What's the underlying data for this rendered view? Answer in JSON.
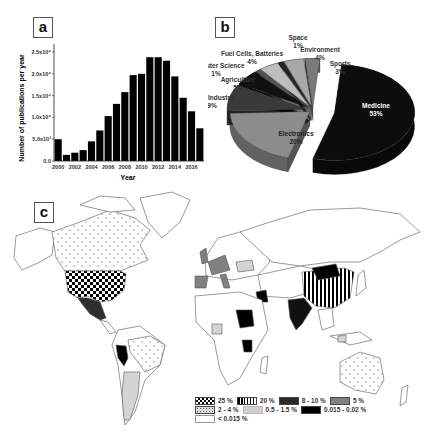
{
  "panels": {
    "a": "a",
    "b": "b",
    "c": "c"
  },
  "chart_data": [
    {
      "type": "bar",
      "title": "",
      "xlabel": "Year",
      "ylabel": "Number of publications per year",
      "categories": [
        "2000",
        "2001",
        "2002",
        "2003",
        "2004",
        "2005",
        "2006",
        "2007",
        "2008",
        "2009",
        "2010",
        "2011",
        "2012",
        "2013",
        "2014",
        "2015",
        "2016",
        "2017"
      ],
      "values": [
        5000,
        1400,
        1900,
        2500,
        4500,
        7000,
        10300,
        13100,
        15800,
        19700,
        20000,
        23800,
        23800,
        23000,
        19400,
        14500,
        11400,
        7500
      ],
      "x_tick_labels": [
        "2000",
        "2002",
        "2004",
        "2006",
        "2008",
        "2010",
        "2012",
        "2014",
        "2016"
      ],
      "y_tick_labels": [
        "0.0",
        "5.0x10³",
        "1.0x10⁴",
        "1.5x10⁴",
        "2.0x10⁴",
        "2.5x10⁴"
      ],
      "ylim": [
        0,
        27000
      ],
      "bar_color": "#000000",
      "grid": false
    },
    {
      "type": "pie",
      "title": "",
      "style": "3d-exploded",
      "slices": [
        {
          "label": "Medicine",
          "value": 53,
          "text": "53%",
          "color": "#0d0d0d"
        },
        {
          "label": "Electronics",
          "value": 20,
          "text": "20%",
          "color": "#8c8c8c"
        },
        {
          "label": "Food Industry",
          "value": 9,
          "text": "9%",
          "color": "#3a3a3a"
        },
        {
          "label": "Agriculture",
          "value": 5,
          "text": "5%",
          "color": "#111111"
        },
        {
          "label": "Computer Science",
          "value": 1,
          "text": "1%",
          "color": "#555555"
        },
        {
          "label": "Fuel Cells, Batteries",
          "value": 4,
          "text": "4%",
          "color": "#bdbdbd"
        },
        {
          "label": "Space",
          "value": 1,
          "text": "1%",
          "color": "#222222"
        },
        {
          "label": "Environment",
          "value": 4,
          "text": "4%",
          "color": "#a9a9a9"
        },
        {
          "label": "Sports",
          "value": 3,
          "text": "3%",
          "color": "#7a7a7a"
        }
      ]
    },
    {
      "type": "choropleth-map",
      "title": "",
      "legend": [
        {
          "label": "25 %",
          "pattern": "checker"
        },
        {
          "label": "20 %",
          "pattern": "vertical-stripes"
        },
        {
          "label": "8 - 10 %",
          "pattern": "dark-gray",
          "color": "#2a2a2a"
        },
        {
          "label": "5 %",
          "pattern": "gray",
          "color": "#808080"
        },
        {
          "label": "2 - 4 %",
          "pattern": "dots-light"
        },
        {
          "label": "0.5 - 1.5 %",
          "pattern": "light-gray",
          "color": "#cfcfcf"
        },
        {
          "label": "0.015 - 0.02 %",
          "pattern": "black",
          "color": "#000000"
        },
        {
          "label": "< 0.015 %",
          "pattern": "white",
          "color": "#ffffff"
        }
      ],
      "regions": [
        {
          "name": "USA",
          "class": "25 %"
        },
        {
          "name": "China",
          "class": "20 %"
        },
        {
          "name": "India",
          "class": "8 - 10 %"
        },
        {
          "name": "Mexico",
          "class": "8 - 10 %"
        },
        {
          "name": "Europe (UK, Germany, France, Spain, Italy)",
          "class": "5 %"
        },
        {
          "name": "Canada",
          "class": "2 - 4 %"
        },
        {
          "name": "Brazil",
          "class": "2 - 4 %"
        },
        {
          "name": "Australia",
          "class": "2 - 4 %"
        },
        {
          "name": "Argentina",
          "class": "0.5 - 1.5 %"
        },
        {
          "name": "Peru",
          "class": "0.015 - 0.02 %"
        },
        {
          "name": "Mongolia",
          "class": "0.015 - 0.02 %"
        },
        {
          "name": "Sudan",
          "class": "0.015 - 0.02 %"
        },
        {
          "name": "Iraq",
          "class": "0.015 - 0.02 %"
        },
        {
          "name": "Tanzania",
          "class": "0.015 - 0.02 %"
        }
      ]
    }
  ]
}
